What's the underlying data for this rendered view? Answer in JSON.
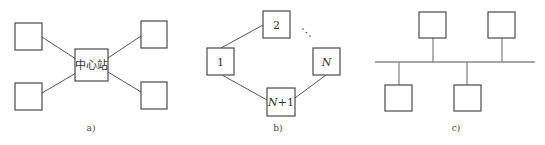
{
  "figure": {
    "panels": [
      {
        "id": "a",
        "caption": "a)",
        "topology": "star",
        "center_label": "中心站",
        "nodes": [
          "",
          "",
          "",
          ""
        ]
      },
      {
        "id": "b",
        "caption": "b)",
        "topology": "ring",
        "nodes": [
          {
            "label": "1",
            "italic": false
          },
          {
            "label": "2",
            "italic": false
          },
          {
            "label": "N",
            "italic": true
          },
          {
            "label_var": "N",
            "label_suffix": "+1"
          }
        ],
        "ellipsis": "⋱"
      },
      {
        "id": "c",
        "caption": "c)",
        "topology": "bus",
        "nodes": [
          "",
          "",
          "",
          ""
        ]
      }
    ]
  },
  "colors": {
    "box_stroke": "#4a4a4a",
    "link": "#555555",
    "bus": "#888888",
    "text": "#333333"
  }
}
